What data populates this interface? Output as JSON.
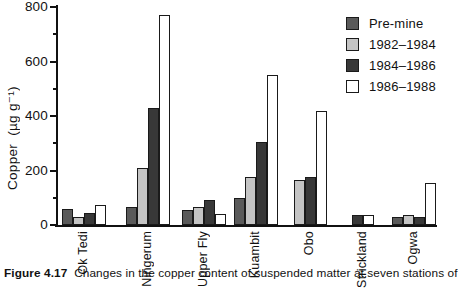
{
  "figure": {
    "caption_label": "Figure 4.17",
    "caption_text": "Changes in the copper content of suspended matter at seven stations of"
  },
  "chart_data": {
    "type": "bar",
    "title": "",
    "xlabel": "",
    "ylabel": "Copper  (µg g⁻¹)",
    "unit": "µg g⁻¹",
    "ylim": [
      0,
      800
    ],
    "yticks_major": [
      0,
      200,
      400,
      600,
      800
    ],
    "yticks_minor": [
      100,
      300,
      500,
      700
    ],
    "grid": false,
    "legend_position": "top-right",
    "categories": [
      "Ok Tedi",
      "Ningerum",
      "Upper Fly",
      "Kuambit",
      "Obo",
      "Strickland",
      "Ogwa"
    ],
    "series": [
      {
        "name": "Pre-mine",
        "color": "#5a5a5a",
        "values": [
          60,
          65,
          55,
          100,
          null,
          null,
          30
        ]
      },
      {
        "name": "1982–1984",
        "color": "#c4c4c4",
        "values": [
          30,
          210,
          65,
          175,
          165,
          null,
          35
        ]
      },
      {
        "name": "1984–1986",
        "color": "#383838",
        "values": [
          45,
          430,
          90,
          305,
          175,
          35,
          30
        ]
      },
      {
        "name": "1986–1988",
        "color": "#ffffff",
        "values": [
          75,
          770,
          40,
          550,
          420,
          35,
          155
        ]
      }
    ]
  }
}
